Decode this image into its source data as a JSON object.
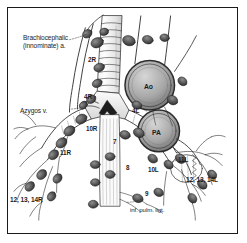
{
  "figure": {
    "border_color": "#1a1a1a",
    "background": "#ffffff",
    "ink_color": "#1b1b1b"
  },
  "vessel_labels": {
    "aorta": "Ao",
    "pulmonary_artery": "PA"
  },
  "leader_labels": {
    "brachiocephalic_line1": "Brachiocephalic",
    "brachiocephalic_line2": "(innominate) a.",
    "azygos": "Azygos v.",
    "inferior_pulmonary_ligament": "inf. pulm. ligt."
  },
  "stations": [
    {
      "id": "2R",
      "label": "2R"
    },
    {
      "id": "4R",
      "label": "4R"
    },
    {
      "id": "4L",
      "label": "4L"
    },
    {
      "id": "10R",
      "label": "10R"
    },
    {
      "id": "11R",
      "label": "11R"
    },
    {
      "id": "10L",
      "label": "10L"
    },
    {
      "id": "11L",
      "label": "11L"
    },
    {
      "id": "7",
      "label": "7"
    },
    {
      "id": "8",
      "label": "8"
    },
    {
      "id": "9",
      "label": "9"
    }
  ],
  "station_groups": [
    {
      "id": "right",
      "label": "12, 13, 14R"
    },
    {
      "id": "left",
      "label": "12, 13, 14L"
    }
  ]
}
